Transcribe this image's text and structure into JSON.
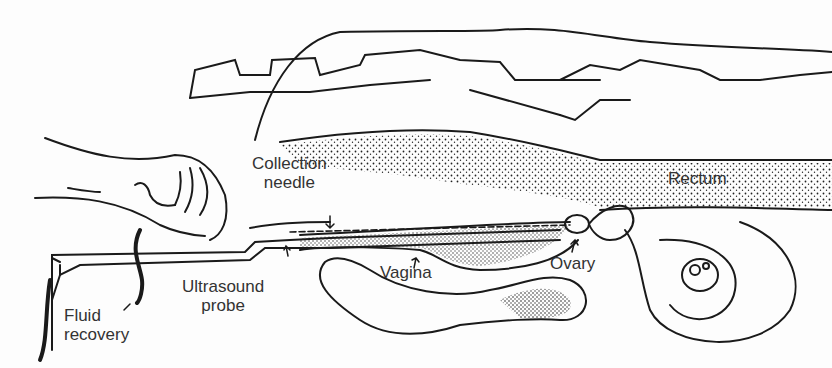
{
  "diagram": {
    "labels": {
      "collection_needle": [
        "Collection",
        "needle"
      ],
      "ultrasound_probe": [
        "Ultrasound",
        "probe"
      ],
      "fluid_recovery": [
        "Fluid",
        "recovery"
      ],
      "vagina": "Vagina",
      "ovary": "Ovary",
      "rectum": "Rectum"
    },
    "colors": {
      "line": "#1a1a1a",
      "text": "#333333",
      "background": "#fdfdfd"
    }
  }
}
